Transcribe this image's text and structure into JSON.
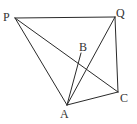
{
  "diagram": {
    "type": "geometry",
    "points": {
      "P": {
        "x": 15,
        "y": 18,
        "label": "P",
        "lx": 3,
        "ly": 21
      },
      "Q": {
        "x": 115,
        "y": 17,
        "label": "Q",
        "lx": 116,
        "ly": 17
      },
      "B": {
        "x": 81,
        "y": 53,
        "label": "B",
        "lx": 79,
        "ly": 51
      },
      "C": {
        "x": 118,
        "y": 92,
        "label": "C",
        "lx": 120,
        "ly": 102
      },
      "A": {
        "x": 67,
        "y": 105,
        "label": "A",
        "lx": 60,
        "ly": 118
      }
    },
    "edges": [
      [
        "P",
        "Q"
      ],
      [
        "Q",
        "C"
      ],
      [
        "P",
        "A"
      ],
      [
        "P",
        "C"
      ],
      [
        "A",
        "B"
      ],
      [
        "A",
        "Q"
      ],
      [
        "A",
        "C"
      ]
    ],
    "line_color": "#2a2a2a",
    "label_color": "#333333"
  }
}
